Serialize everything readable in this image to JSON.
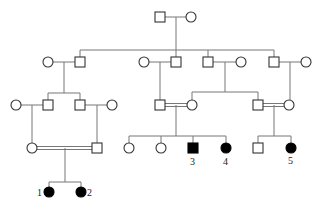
{
  "diagram": {
    "type": "pedigree",
    "legend": "square = male, circle = female, filled = affected, double line = consanguineous marriage",
    "labels": {
      "p1": "1",
      "p2": "2",
      "p3": "3",
      "p4": "4",
      "p5": "5"
    },
    "generations": [
      {
        "gen": "I",
        "individuals": [
          "male",
          "female"
        ]
      },
      {
        "gen": "II",
        "individuals": [
          "female (spouse)",
          "male",
          "female (spouse)",
          "male",
          "male",
          "female (spouse)",
          "male",
          "female (spouse)"
        ]
      },
      {
        "gen": "III",
        "individuals": [
          "female (spouse)",
          "male",
          "male",
          "female (spouse)",
          "male",
          "female",
          "male",
          "female"
        ]
      },
      {
        "gen": "IV",
        "individuals": [
          "female",
          "male",
          "female",
          "female",
          "male affected (3)",
          "female affected (4)",
          "male",
          "female affected (5)"
        ]
      },
      {
        "gen": "V",
        "individuals": [
          "female affected (1)",
          "female affected (2)"
        ]
      }
    ],
    "colors": {
      "line": "#777777",
      "symbol_stroke": "#333333",
      "affected": "#000000"
    }
  }
}
